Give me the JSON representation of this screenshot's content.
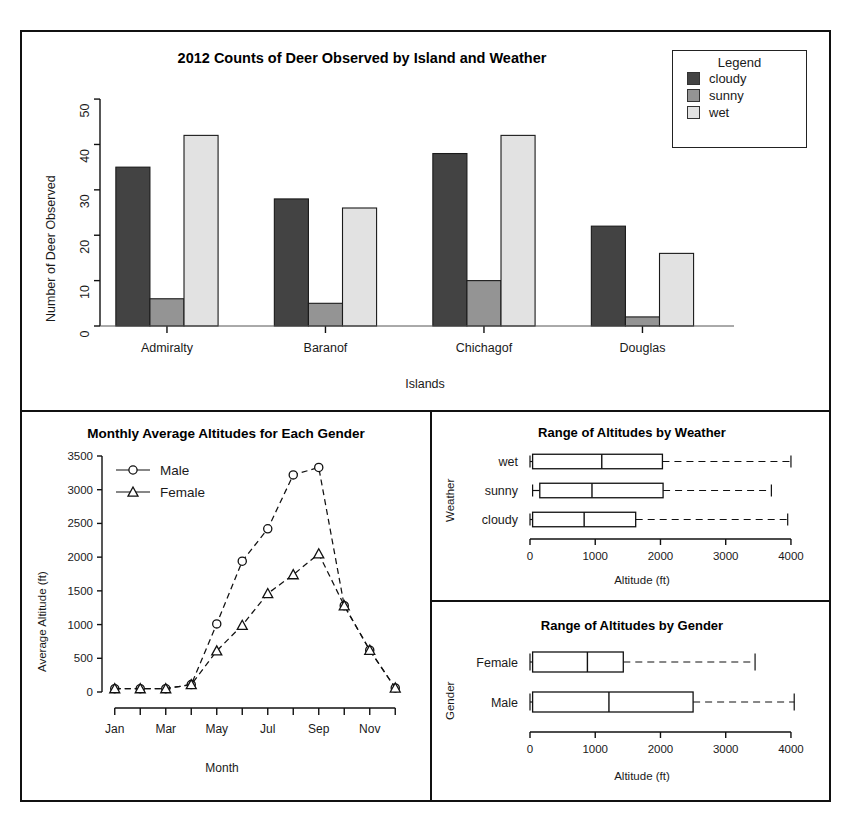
{
  "figure": {
    "panels": [
      "bar-chart-panel",
      "line-chart-panel",
      "boxplot-weather-panel",
      "boxplot-gender-panel"
    ]
  },
  "legend": {
    "title": "Legend",
    "items": [
      {
        "label": "cloudy",
        "color": "#434343"
      },
      {
        "label": "sunny",
        "color": "#949494"
      },
      {
        "label": "wet",
        "color": "#e2e2e2"
      }
    ]
  },
  "line_legend": {
    "items": [
      {
        "label": "Male",
        "marker": "circle"
      },
      {
        "label": "Female",
        "marker": "triangle"
      }
    ]
  },
  "chart_data": [
    {
      "id": "bar-chart",
      "type": "bar",
      "title": "2012 Counts of Deer Observed by Island and Weather",
      "xlabel": "Islands",
      "ylabel": "Number of Deer Observed",
      "categories": [
        "Admiralty",
        "Baranof",
        "Chichagof",
        "Douglas"
      ],
      "ylim": [
        0,
        52
      ],
      "yticks": [
        0,
        10,
        20,
        30,
        40,
        50
      ],
      "grid": false,
      "legend_position": "top-right",
      "series": [
        {
          "name": "cloudy",
          "color": "#434343",
          "values": [
            35,
            28,
            38,
            22
          ]
        },
        {
          "name": "sunny",
          "color": "#949494",
          "values": [
            6,
            5,
            10,
            2
          ]
        },
        {
          "name": "wet",
          "color": "#e2e2e2",
          "values": [
            42,
            26,
            42,
            16
          ]
        }
      ]
    },
    {
      "id": "line-chart",
      "type": "line",
      "title": "Monthly Average Altitudes for Each Gender",
      "xlabel": "Month",
      "ylabel": "Average Altitude (ft)",
      "x": [
        "Jan",
        "Feb",
        "Mar",
        "Apr",
        "May",
        "Jun",
        "Jul",
        "Aug",
        "Sep",
        "Oct",
        "Nov",
        "Dec"
      ],
      "xtick_labels": [
        "Jan",
        "",
        "Mar",
        "",
        "May",
        "",
        "Jul",
        "",
        "Sep",
        "",
        "Nov",
        ""
      ],
      "ylim": [
        0,
        3500
      ],
      "yticks": [
        0,
        500,
        1000,
        1500,
        2000,
        2500,
        3000,
        3500
      ],
      "grid": false,
      "legend_position": "top-left",
      "series": [
        {
          "name": "Male",
          "marker": "circle",
          "linestyle": "dashed",
          "values": [
            50,
            50,
            50,
            110,
            1010,
            1940,
            2420,
            3220,
            3330,
            1280,
            620,
            60
          ]
        },
        {
          "name": "Female",
          "marker": "triangle",
          "linestyle": "dashed",
          "values": [
            50,
            50,
            50,
            110,
            610,
            990,
            1460,
            1740,
            2050,
            1280,
            620,
            60
          ]
        }
      ]
    },
    {
      "id": "boxplot-weather",
      "type": "box",
      "title": "Range of Altitudes by Weather",
      "xlabel": "Altitude (ft)",
      "ylabel": "Weather",
      "orientation": "horizontal",
      "xlim": [
        0,
        4200
      ],
      "xticks": [
        0,
        1000,
        2000,
        3000,
        4000
      ],
      "categories": [
        "wet",
        "sunny",
        "cloudy"
      ],
      "boxes": [
        {
          "label": "wet",
          "min": 0,
          "q1": 40,
          "median": 1100,
          "q3": 2030,
          "max": 4000
        },
        {
          "label": "sunny",
          "min": 40,
          "q1": 150,
          "median": 950,
          "q3": 2040,
          "max": 3700
        },
        {
          "label": "cloudy",
          "min": 0,
          "q1": 40,
          "median": 830,
          "q3": 1620,
          "max": 3950
        }
      ]
    },
    {
      "id": "boxplot-gender",
      "type": "box",
      "title": "Range of Altitudes by Gender",
      "xlabel": "Altitude (ft)",
      "ylabel": "Gender",
      "orientation": "horizontal",
      "xlim": [
        0,
        4200
      ],
      "xticks": [
        0,
        1000,
        2000,
        3000,
        4000
      ],
      "categories": [
        "Female",
        "Male"
      ],
      "boxes": [
        {
          "label": "Female",
          "min": 0,
          "q1": 40,
          "median": 880,
          "q3": 1430,
          "max": 3450
        },
        {
          "label": "Male",
          "min": 0,
          "q1": 40,
          "median": 1210,
          "q3": 2500,
          "max": 4050
        }
      ]
    }
  ]
}
